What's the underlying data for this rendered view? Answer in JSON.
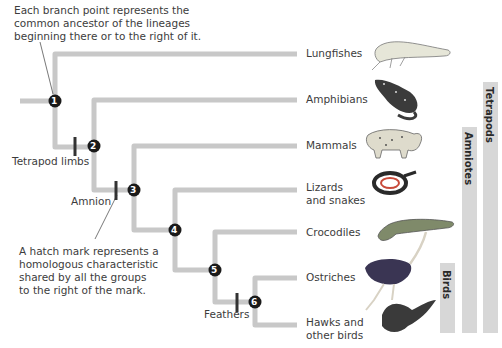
{
  "annotations": {
    "branch_point": [
      "Each branch point represents the",
      "common ancestor of the lineages",
      "beginning there or to the right of it."
    ],
    "hatch_mark": [
      "A hatch mark represents a",
      "homologous characteristic",
      "shared by all the groups",
      "to the right of the mark."
    ]
  },
  "characters": {
    "tetrapod_limbs": "Tetrapod limbs",
    "amnion": "Amnion",
    "feathers": "Feathers"
  },
  "nodes": [
    "1",
    "2",
    "3",
    "4",
    "5",
    "6"
  ],
  "taxa": [
    {
      "lines": [
        "Lungfishes"
      ],
      "icon": "lungfish-icon"
    },
    {
      "lines": [
        "Amphibians"
      ],
      "icon": "salamander-icon"
    },
    {
      "lines": [
        "Mammals"
      ],
      "icon": "bobcat-icon"
    },
    {
      "lines": [
        "Lizards",
        "and snakes"
      ],
      "icon": "snake-icon"
    },
    {
      "lines": [
        "Crocodiles"
      ],
      "icon": "crocodile-icon"
    },
    {
      "lines": [
        "Ostriches"
      ],
      "icon": "ostrich-icon"
    },
    {
      "lines": [
        "Hawks and",
        "other birds"
      ],
      "icon": "hawk-icon"
    }
  ],
  "clades": {
    "tetrapods": "Tetrapods",
    "amniotes": "Amniotes",
    "birds": "Birds"
  },
  "colors": {
    "branch": "#c8c8c8",
    "node": "#1a1a1a",
    "hatch": "#333333",
    "clade_bar": "#d7d7d7"
  }
}
